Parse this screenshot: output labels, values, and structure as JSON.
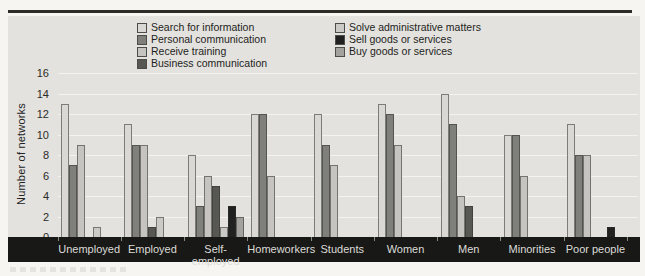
{
  "figure": {
    "y_axis_label": "Number of networks"
  },
  "colors": {
    "page_bg": "#f6f5f2",
    "panel_bg": "#e3e2de",
    "band_bg": "#181816",
    "gridline": "#f4f3f0",
    "top_rule": "#2c2c2a",
    "category_text": "#dddcd8",
    "axis_text": "#2b2b28"
  },
  "chart_data": {
    "type": "bar",
    "title": "",
    "xlabel": "",
    "ylabel": "Number of networks",
    "ylim": [
      0,
      16
    ],
    "y_tick_step": 2,
    "grid": true,
    "legend_position": "top",
    "categories": [
      "Unemployed",
      "Employed",
      "Self-employed",
      "Homeworkers",
      "Students",
      "Women",
      "Men",
      "Minorities",
      "Poor people"
    ],
    "series": [
      {
        "name": "Search for information",
        "color": "#d9d8d4",
        "values": [
          13,
          11,
          8,
          12,
          12,
          13,
          14,
          10,
          11
        ]
      },
      {
        "name": "Personal communication",
        "color": "#7f7f7b",
        "values": [
          7,
          9,
          3,
          12,
          9,
          12,
          11,
          10,
          8
        ]
      },
      {
        "name": "Receive training",
        "color": "#c5c4c0",
        "values": [
          9,
          9,
          6,
          6,
          7,
          9,
          4,
          6,
          8
        ]
      },
      {
        "name": "Business communication",
        "color": "#575753",
        "values": [
          0,
          1,
          5,
          0,
          0,
          0,
          3,
          0,
          0
        ]
      },
      {
        "name": "Solve administrative matters",
        "color": "#cbcac6",
        "values": [
          1,
          2,
          1,
          0,
          0,
          0,
          0,
          0,
          0
        ]
      },
      {
        "name": "Sell goods or services",
        "color": "#21211f",
        "values": [
          0,
          0,
          3,
          0,
          0,
          0,
          0,
          0,
          1
        ]
      },
      {
        "name": "Buy goods or services",
        "color": "#a3a29e",
        "values": [
          0,
          0,
          2,
          0,
          0,
          0,
          0,
          0,
          0
        ]
      }
    ]
  }
}
